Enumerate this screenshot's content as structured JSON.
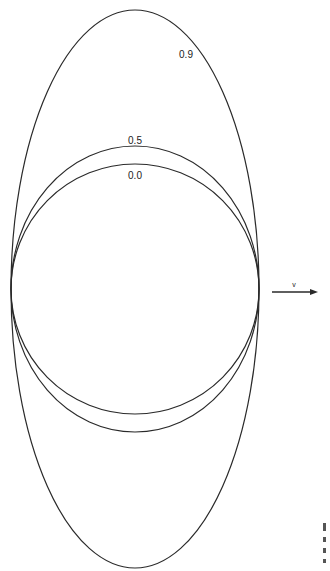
{
  "diagram": {
    "center": {
      "x": 135,
      "y": 289
    },
    "curves": [
      {
        "label": "0.0",
        "rx": 124,
        "ry": 125,
        "label_x": 135,
        "label_y": 179
      },
      {
        "label": "0.5",
        "rx": 124,
        "ry": 143,
        "label_x": 135,
        "label_y": 144
      },
      {
        "label": "0.9",
        "rx": 124,
        "ry": 279,
        "label_x": 186,
        "label_y": 58
      }
    ],
    "velocity_arrow": {
      "label": "v",
      "x1": 272,
      "x2": 318,
      "y": 292
    },
    "stroke_color": "#2a2a2a",
    "background": "#ffffff"
  }
}
